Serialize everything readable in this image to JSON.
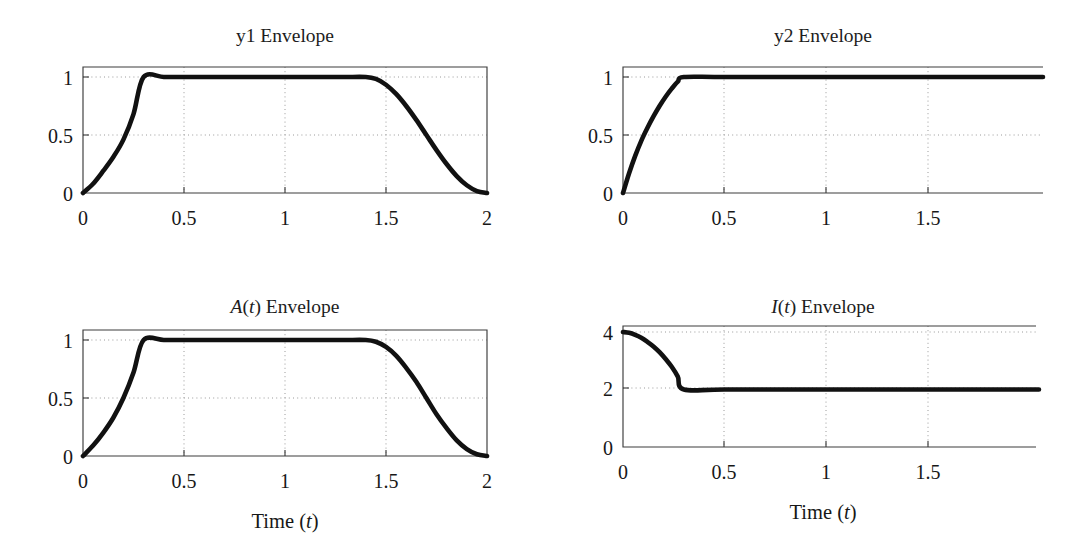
{
  "figure": {
    "background_color": "#ffffff",
    "curve_color": "#111111",
    "axis_color": "#3c3c3c",
    "grid_color": "#9a9a9a",
    "grid": true,
    "layout": "2x2 panel grid",
    "panel_count": 4
  },
  "panels": {
    "y1": {
      "title_plain": "y1 Envelope",
      "title_main": "y1",
      "title_suffix": " Envelope",
      "xlabel": "",
      "ylabel": "",
      "xticks": [
        "0",
        "0.5",
        "1",
        "1.5",
        "2"
      ],
      "yticks": [
        "0",
        "0.5",
        "1"
      ]
    },
    "y2": {
      "title_plain": "y2 Envelope",
      "title_main": "y2",
      "title_suffix": " Envelope",
      "xlabel": "",
      "ylabel": "",
      "xticks": [
        "0",
        "0.5",
        "1",
        "1.5"
      ],
      "yticks": [
        "0",
        "0.5",
        "1"
      ]
    },
    "A": {
      "title_plain": "A(t) Envelope",
      "title_italic_1": "A",
      "title_paren_open": "(",
      "title_italic_2": "t",
      "title_paren_close": ")",
      "title_suffix": " Envelope",
      "xlabel_prefix": "Time (",
      "xlabel_italic": "t",
      "xlabel_suffix": ")",
      "xlabel_plain": "Time (t)",
      "xticks": [
        "0",
        "0.5",
        "1",
        "1.5",
        "2"
      ],
      "yticks": [
        "0",
        "0.5",
        "1"
      ]
    },
    "I": {
      "title_plain": "I(t) Envelope",
      "title_italic_1": "I",
      "title_paren_open": "(",
      "title_italic_2": "t",
      "title_paren_close": ")",
      "title_suffix": " Envelope",
      "xlabel_prefix": "Time (",
      "xlabel_italic": "t",
      "xlabel_suffix": ")",
      "xlabel_plain": "Time (t)",
      "xticks": [
        "0",
        "0.5",
        "1",
        "1.5"
      ],
      "yticks": [
        "0",
        "2",
        "4"
      ]
    }
  },
  "chart_data": [
    {
      "type": "line",
      "title": "y1 Envelope",
      "xlabel": "",
      "ylabel": "",
      "xlim": [
        0,
        2
      ],
      "ylim": [
        0,
        1.07
      ],
      "xticks": [
        0,
        0.5,
        1,
        1.5,
        2
      ],
      "yticks": [
        0,
        0.5,
        1
      ],
      "grid": true,
      "legend": null,
      "description": "Rising exponential-like attack from 0 to 1 over t=0 to 0.3, flat plateau at 1 until t=1.4, raised-cosine decay back to 0 at t=2",
      "x": [
        0,
        0.05,
        0.1,
        0.15,
        0.2,
        0.25,
        0.3,
        0.4,
        0.5,
        0.6,
        0.7,
        0.8,
        0.9,
        1.0,
        1.1,
        1.2,
        1.3,
        1.4,
        1.45,
        1.5,
        1.55,
        1.6,
        1.65,
        1.7,
        1.75,
        1.8,
        1.85,
        1.9,
        1.95,
        2.0
      ],
      "y": [
        0.0,
        0.08,
        0.19,
        0.31,
        0.46,
        0.68,
        1.0,
        1.0,
        1.0,
        1.0,
        1.0,
        1.0,
        1.0,
        1.0,
        1.0,
        1.0,
        1.0,
        1.0,
        0.983,
        0.933,
        0.854,
        0.75,
        0.63,
        0.5,
        0.37,
        0.25,
        0.146,
        0.067,
        0.017,
        0.0
      ]
    },
    {
      "type": "line",
      "title": "y2 Envelope",
      "xlabel": "",
      "ylabel": "",
      "xlim": [
        0,
        2
      ],
      "ylim": [
        0,
        1.07
      ],
      "xticks": [
        0,
        0.5,
        1,
        1.5
      ],
      "yticks": [
        0,
        0.5,
        1
      ],
      "grid": true,
      "legend": null,
      "description": "Concave saturating attack from 0 to 1 over t=0 to 0.3, then constant at 1 for the rest of the record",
      "x": [
        0,
        0.03,
        0.06,
        0.09,
        0.12,
        0.15,
        0.18,
        0.21,
        0.24,
        0.27,
        0.3,
        0.5,
        1.0,
        1.5,
        2.0
      ],
      "y": [
        0.0,
        0.17,
        0.32,
        0.45,
        0.56,
        0.66,
        0.75,
        0.83,
        0.9,
        0.96,
        1.0,
        1.0,
        1.0,
        1.0,
        1.0
      ]
    },
    {
      "type": "line",
      "title": "A(t) Envelope",
      "xlabel": "Time (t)",
      "ylabel": "",
      "xlim": [
        0,
        2
      ],
      "ylim": [
        0,
        1.07
      ],
      "xticks": [
        0,
        0.5,
        1,
        1.5,
        2
      ],
      "yticks": [
        0,
        0.5,
        1
      ],
      "grid": true,
      "legend": null,
      "description": "Combined amplitude envelope: attack to 1 by t=0.3, plateau at 1 until t=1.4, smooth decay to 0 at t=2",
      "x": [
        0,
        0.05,
        0.1,
        0.15,
        0.2,
        0.25,
        0.3,
        0.4,
        0.5,
        0.6,
        0.7,
        0.8,
        0.9,
        1.0,
        1.1,
        1.2,
        1.3,
        1.4,
        1.45,
        1.5,
        1.55,
        1.6,
        1.65,
        1.7,
        1.75,
        1.8,
        1.85,
        1.9,
        1.95,
        2.0
      ],
      "y": [
        0.0,
        0.09,
        0.2,
        0.33,
        0.5,
        0.72,
        1.0,
        1.0,
        1.0,
        1.0,
        1.0,
        1.0,
        1.0,
        1.0,
        1.0,
        1.0,
        1.0,
        1.0,
        0.985,
        0.94,
        0.865,
        0.76,
        0.64,
        0.5,
        0.36,
        0.24,
        0.135,
        0.06,
        0.015,
        0.0
      ]
    },
    {
      "type": "line",
      "title": "I(t) Envelope",
      "xlabel": "Time (t)",
      "ylabel": "",
      "xlim": [
        0,
        2
      ],
      "ylim": [
        0,
        4.3
      ],
      "xticks": [
        0,
        0.5,
        1,
        1.5
      ],
      "yticks": [
        0,
        2,
        4
      ],
      "grid": true,
      "legend": null,
      "description": "Starts at 4, decays with concave-down shape to 2 at t=0.3, then constant at 2 for the rest of the record",
      "x": [
        0,
        0.03,
        0.06,
        0.09,
        0.12,
        0.15,
        0.18,
        0.21,
        0.24,
        0.27,
        0.3,
        0.5,
        1.0,
        1.5,
        2.0
      ],
      "y": [
        4.0,
        3.97,
        3.9,
        3.8,
        3.66,
        3.5,
        3.3,
        3.06,
        2.79,
        2.45,
        2.0,
        2.0,
        2.0,
        2.0,
        2.0
      ]
    }
  ]
}
